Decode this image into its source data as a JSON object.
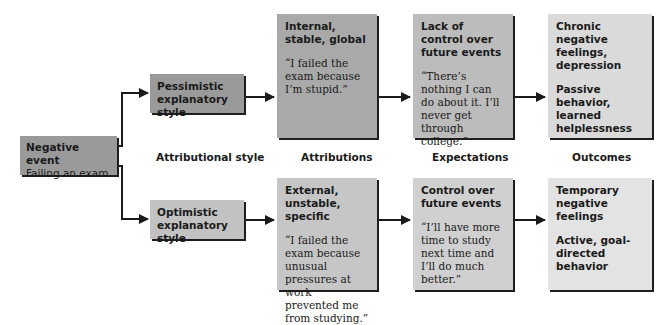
{
  "diagram": {
    "start": {
      "title": "Negative event",
      "subtitle": "Failing an exam",
      "color": "#9a9a9a"
    },
    "columns": [
      {
        "label": "Attributional style"
      },
      {
        "label": "Attributions"
      },
      {
        "label": "Expectations"
      },
      {
        "label": "Outcomes"
      }
    ],
    "pessimistic": {
      "style": {
        "title": "Pessimistic explanatory style",
        "color": "#9a9a9a"
      },
      "attribution": {
        "title": "Internal, stable, global",
        "quote": "“I failed the exam because I’m stupid.”",
        "color": "#a9a9a9"
      },
      "expectation": {
        "title": "Lack of control over future events",
        "quote": "“There’s nothing I can do about it. I’ll never get through college.”",
        "color": "#bcbcbc"
      },
      "outcome": {
        "title": "Chronic negative feelings, depression",
        "detail": "Passive behavior, learned helplessness",
        "color": "#dadada"
      }
    },
    "optimistic": {
      "style": {
        "title": "Optimistic explanatory style",
        "color": "#c2c2c2"
      },
      "attribution": {
        "title": "External, unstable, specific",
        "quote": "“I failed the exam because unusual pressures at work prevented me from studying.”",
        "color": "#c6c6c6"
      },
      "expectation": {
        "title": "Control over future events",
        "quote": "“I’ll have more time to study next time and I’ll do much better.”",
        "color": "#d0d0d0"
      },
      "outcome": {
        "title": "Temporary negative feelings",
        "detail": "Active, goal-directed behavior",
        "color": "#e3e3e3"
      }
    },
    "icons": [
      "arrow-right-icon"
    ]
  }
}
